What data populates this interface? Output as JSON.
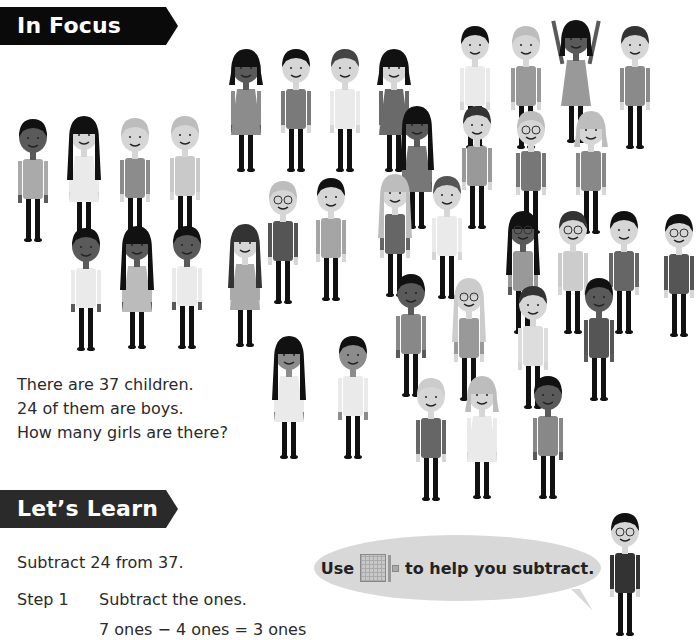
{
  "sections": {
    "in_focus": {
      "title": "In Focus",
      "problem_lines": [
        "There are 37 children.",
        "24 of them are boys.",
        "How many girls are there?"
      ]
    },
    "lets_learn": {
      "title": "Let’s Learn",
      "intro": "Subtract 24 from 37.",
      "steps": [
        {
          "label": "Step 1",
          "text": "Subtract the ones.",
          "equation": "7 ones − 4 ones = 3 ones"
        }
      ]
    }
  },
  "speech_bubble": {
    "prefix": "Use",
    "icon": "base-ten-blocks-icon",
    "suffix": "to help you subtract."
  },
  "illustration": {
    "total_children": 37,
    "boys": 24
  },
  "colors": {
    "banner": "#0a0a0a",
    "banner_text": "#ffffff",
    "bubble": "#d8d8d8",
    "text": "#2a2a2a"
  }
}
